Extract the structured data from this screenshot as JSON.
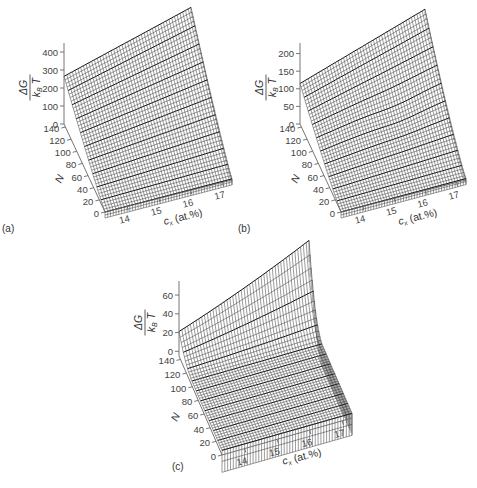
{
  "figure": {
    "panels": [
      "(a)",
      "(b)",
      "(c)"
    ]
  },
  "chart_data": [
    {
      "type": "surface",
      "panel": "(a)",
      "zlabel_num": "ΔG",
      "zlabel_den": "k_B T",
      "xlabel": "c_x (at.%)",
      "ylabel": "N",
      "x_ticks": [
        "14",
        "15",
        "16",
        "17"
      ],
      "y_ticks": [
        "0",
        "20",
        "40",
        "60",
        "80",
        "100",
        "120",
        "140"
      ],
      "z_ticks": [
        "0",
        "100",
        "200",
        "300",
        "400"
      ],
      "zlim": [
        0,
        450
      ],
      "xlim": [
        13.3,
        17.3
      ],
      "ylim": [
        0,
        145
      ],
      "description": "Monotonic surface rising with N; approx 260 at (c=13.3,N=145), approx 450+ at (c=17.3,N=145), near 0 at N=0",
      "corner_values": {
        "c13_N0": 0,
        "c17_N0": 5,
        "c13_N145": 265,
        "c17_N145": 470
      }
    },
    {
      "type": "surface",
      "panel": "(b)",
      "zlabel_num": "ΔG",
      "zlabel_den": "k_B T",
      "xlabel": "c_x (at.%)",
      "ylabel": "N",
      "x_ticks": [
        "14",
        "15",
        "16",
        "17"
      ],
      "y_ticks": [
        "0",
        "20",
        "40",
        "60",
        "80",
        "100",
        "120",
        "140"
      ],
      "z_ticks": [
        "0",
        "50",
        "100",
        "150",
        "200"
      ],
      "zlim": [
        0,
        230
      ],
      "xlim": [
        13.3,
        17.3
      ],
      "ylim": [
        0,
        145
      ],
      "description": "Surface rising with N with shallow local minimum contours near c≈15.5-16.5, N≈80",
      "corner_values": {
        "c13_N0": 0,
        "c17_N0": 5,
        "c13_N145": 115,
        "c17_N145": 235
      }
    },
    {
      "type": "surface",
      "panel": "(c)",
      "zlabel_num": "ΔG",
      "zlabel_den": "k_B T",
      "xlabel": "c_x (at.%)",
      "ylabel": "N",
      "x_ticks": [
        "14",
        "15",
        "16",
        "17"
      ],
      "y_ticks": [
        "0",
        "20",
        "40",
        "60",
        "80",
        "100",
        "120",
        "140"
      ],
      "z_ticks": [
        "0",
        "20",
        "40",
        "60"
      ],
      "zlim": [
        -5,
        75
      ],
      "xlim": [
        13.3,
        17.3
      ],
      "ylim": [
        0,
        145
      ],
      "description": "Saddle/valley surface: steep rise at N→0 edge, valley near N≈100, rising strongly toward high c and high N",
      "corner_values": {
        "c13_N0": 0,
        "c17_N0": 0,
        "c13_N145": 20,
        "c17_N145": 75
      }
    }
  ]
}
